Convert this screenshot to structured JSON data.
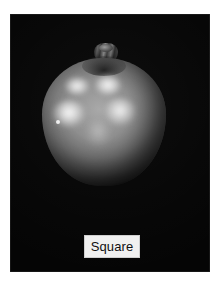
{
  "page": {
    "background_color": "#ffffff",
    "width": 222,
    "height": 292
  },
  "figure": {
    "name": "apple-photograph",
    "background_color": "#050505"
  },
  "subject": {
    "name": "apple",
    "stem_name": "apple-stem",
    "body_color": "#8f8f8f",
    "highlight_color": "#ffffff",
    "shadow_color": "#121212"
  },
  "caption": {
    "text": "Square",
    "background_color": "#f0f0f0",
    "border_color": "#cfcfcf",
    "text_color": "#101010"
  }
}
